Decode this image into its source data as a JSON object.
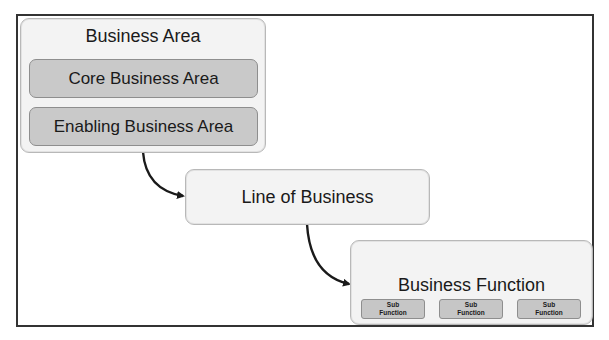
{
  "diagram": {
    "business_area": {
      "title": "Business Area",
      "children": [
        "Core Business Area",
        "Enabling Business Area"
      ]
    },
    "line_of_business": {
      "title": "Line of Business"
    },
    "business_function": {
      "title": "Business Function",
      "sub_functions": [
        {
          "line1": "Sub",
          "line2": "Function"
        },
        {
          "line1": "Sub",
          "line2": "Function"
        },
        {
          "line1": "Sub",
          "line2": "Function"
        }
      ]
    },
    "colors": {
      "outer_box": "#f3f3f3",
      "inner_box": "#c9c9c9",
      "border": "#333333",
      "arrow": "#1a1a1a"
    }
  }
}
